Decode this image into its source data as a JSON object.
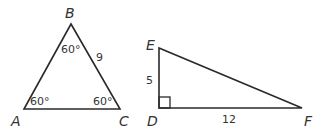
{
  "triangles": [
    {
      "name": "ABC",
      "vertices": {
        "A": "A",
        "B": "B",
        "C": "C"
      },
      "angles": {
        "A": "60°",
        "B": "60°",
        "C": "60°"
      },
      "side_BC": "9"
    },
    {
      "name": "DEF",
      "vertices": {
        "D": "D",
        "E": "E",
        "F": "F"
      },
      "side_DE": "5",
      "side_DF": "12",
      "right_angle_at": "D"
    }
  ],
  "colors": {
    "stroke": "#2a2a2a",
    "text": "#333333"
  }
}
